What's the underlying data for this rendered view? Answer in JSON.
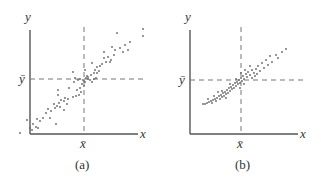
{
  "chart_data": [
    {
      "type": "scatter",
      "title": "",
      "caption": "(a)",
      "xlabel": "x",
      "ylabel": "y",
      "mean_labels": {
        "x": "x̄",
        "y": "ȳ"
      },
      "reference_lines": [
        {
          "orientation": "horizontal",
          "at": "ȳ",
          "style": "dashed"
        },
        {
          "orientation": "vertical",
          "at": "x̄",
          "style": "dashed"
        }
      ],
      "grid": false,
      "description": "Widely spread positive linear relationship between x and y",
      "points": [
        [
          143,
          29
        ],
        [
          143,
          36
        ],
        [
          117,
          33
        ],
        [
          130,
          42
        ],
        [
          125,
          45
        ],
        [
          120,
          48
        ],
        [
          128,
          50
        ],
        [
          115,
          50
        ],
        [
          123,
          52
        ],
        [
          114,
          55
        ],
        [
          108,
          57
        ],
        [
          104,
          58
        ],
        [
          111,
          60
        ],
        [
          106,
          62
        ],
        [
          102,
          64
        ],
        [
          110,
          62
        ],
        [
          100,
          66
        ],
        [
          97,
          67
        ],
        [
          92,
          63
        ],
        [
          95,
          70
        ],
        [
          99,
          71
        ],
        [
          97,
          73
        ],
        [
          91,
          75
        ],
        [
          88,
          77
        ],
        [
          86,
          78
        ],
        [
          84,
          81
        ],
        [
          88,
          79
        ],
        [
          90,
          80
        ],
        [
          94,
          79
        ],
        [
          96,
          78
        ],
        [
          85,
          82
        ],
        [
          83,
          80
        ],
        [
          80,
          79
        ],
        [
          78,
          80
        ],
        [
          75,
          78
        ],
        [
          74,
          82
        ],
        [
          82,
          84
        ],
        [
          84,
          86
        ],
        [
          80,
          88
        ],
        [
          77,
          90
        ],
        [
          79,
          95
        ],
        [
          76,
          96
        ],
        [
          73,
          97
        ],
        [
          69,
          88
        ],
        [
          65,
          98
        ],
        [
          64,
          101
        ],
        [
          61,
          100
        ],
        [
          58,
          95
        ],
        [
          59,
          103
        ],
        [
          60,
          107
        ],
        [
          57,
          106
        ],
        [
          55,
          108
        ],
        [
          54,
          104
        ],
        [
          51,
          111
        ],
        [
          48,
          109
        ],
        [
          50,
          118
        ],
        [
          46,
          113
        ],
        [
          43,
          118
        ],
        [
          40,
          121
        ],
        [
          37,
          119
        ],
        [
          33,
          124
        ],
        [
          36,
          127
        ],
        [
          32,
          130
        ],
        [
          38,
          128
        ],
        [
          30,
          128
        ],
        [
          27,
          120
        ],
        [
          20,
          133
        ],
        [
          56,
          124
        ],
        [
          73,
          72
        ],
        [
          85,
          70
        ],
        [
          94,
          73
        ],
        [
          58,
          90
        ],
        [
          67,
          104
        ],
        [
          64,
          110
        ],
        [
          68,
          99
        ],
        [
          104,
          52
        ],
        [
          112,
          47
        ],
        [
          87,
          76
        ],
        [
          92,
          82
        ],
        [
          81,
          92
        ]
      ]
    },
    {
      "type": "scatter",
      "title": "",
      "caption": "(b)",
      "xlabel": "x",
      "ylabel": "y",
      "mean_labels": {
        "x": "x̄",
        "y": "ȳ"
      },
      "reference_lines": [
        {
          "orientation": "horizontal",
          "at": "ȳ",
          "style": "dashed"
        },
        {
          "orientation": "vertical",
          "at": "x̄",
          "style": "dashed"
        }
      ],
      "grid": false,
      "description": "Tightly clustered positive linear relationship between x and y",
      "points": [
        [
          286,
          49
        ],
        [
          282,
          52
        ],
        [
          276,
          55
        ],
        [
          270,
          56
        ],
        [
          278,
          58
        ],
        [
          266,
          60
        ],
        [
          272,
          62
        ],
        [
          262,
          63
        ],
        [
          268,
          65
        ],
        [
          258,
          66
        ],
        [
          264,
          68
        ],
        [
          256,
          69
        ],
        [
          252,
          70
        ],
        [
          260,
          71
        ],
        [
          248,
          72
        ],
        [
          254,
          73
        ],
        [
          246,
          74
        ],
        [
          250,
          75
        ],
        [
          243,
          76
        ],
        [
          247,
          77
        ],
        [
          241,
          78
        ],
        [
          244,
          79
        ],
        [
          239,
          80
        ],
        [
          242,
          81
        ],
        [
          237,
          82
        ],
        [
          240,
          83
        ],
        [
          235,
          83
        ],
        [
          238,
          84
        ],
        [
          233,
          85
        ],
        [
          236,
          86
        ],
        [
          231,
          87
        ],
        [
          234,
          88
        ],
        [
          229,
          88
        ],
        [
          232,
          89
        ],
        [
          227,
          90
        ],
        [
          230,
          91
        ],
        [
          225,
          92
        ],
        [
          228,
          93
        ],
        [
          223,
          93
        ],
        [
          226,
          94
        ],
        [
          221,
          95
        ],
        [
          224,
          96
        ],
        [
          219,
          96
        ],
        [
          222,
          97
        ],
        [
          217,
          98
        ],
        [
          220,
          99
        ],
        [
          215,
          99
        ],
        [
          213,
          100
        ],
        [
          216,
          101
        ],
        [
          211,
          101
        ],
        [
          209,
          102
        ],
        [
          212,
          103
        ],
        [
          207,
          103
        ],
        [
          205,
          104
        ],
        [
          203,
          104
        ],
        [
          245,
          70
        ],
        [
          250,
          66
        ],
        [
          241,
          73
        ],
        [
          255,
          76
        ],
        [
          218,
          92
        ],
        [
          214,
          96
        ],
        [
          230,
          84
        ],
        [
          236,
          79
        ],
        [
          244,
          84
        ],
        [
          252,
          78
        ],
        [
          257,
          74
        ],
        [
          240,
          88
        ],
        [
          226,
          98
        ],
        [
          222,
          91
        ],
        [
          208,
          99
        ]
      ]
    }
  ],
  "panels": [
    {
      "caption": "(a)",
      "xlabel": "x",
      "ylabel": "y",
      "xbar": "x̄",
      "ybar": "ȳ"
    },
    {
      "caption": "(b)",
      "xlabel": "x",
      "ylabel": "y",
      "xbar": "x̄",
      "ybar": "ȳ"
    }
  ],
  "colors": {
    "axis": "#555555",
    "dash": "#777777",
    "point": "#666666",
    "text": "#333333"
  }
}
